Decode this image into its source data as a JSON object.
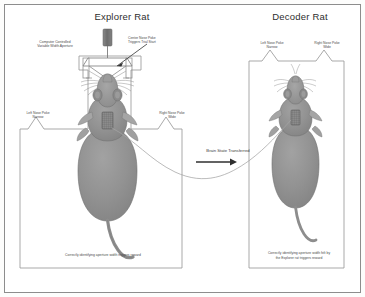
{
  "figure": {
    "explorer": {
      "title": "Explorer Rat",
      "aperture_label": "Computer Controlled\nVariable Width Aperture",
      "aperture_label_line1": "Computer Controlled",
      "aperture_label_line2": "Variable Width Aperture",
      "center_poke_line1": "Center Nose Poke",
      "center_poke_line2": "Triggers Trial Start",
      "left_poke_line1": "Left Nose Poke",
      "left_poke_line2": "Narrow",
      "right_poke_line1": "Right Nose Poke",
      "right_poke_line2": "Wide",
      "caption": "Correctly identifying aperture width triggers reward"
    },
    "decoder": {
      "title": "Decoder Rat",
      "left_poke_line1": "Left Nose Poke",
      "left_poke_line2": "Narrow",
      "right_poke_line1": "Right Nose Poke",
      "right_poke_line2": "Wide",
      "caption_line1": "Correctly identifying aperture width felt by",
      "caption_line2": "the Explorer rat triggers reward"
    },
    "transfer": {
      "label": "Brain State Transferred"
    },
    "colors": {
      "rat_body": "#8f8f8f",
      "rat_outline": "#6d6d6d",
      "chamber_line": "#9a9a9a",
      "frame": "#8d8d8d",
      "actuator": "#707070",
      "text": "#4a4a4a",
      "background": "#ffffff"
    }
  }
}
